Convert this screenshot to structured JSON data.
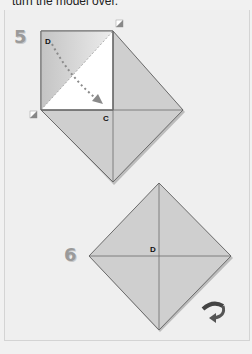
{
  "instruction_text": "turn the model over.",
  "steps": [
    {
      "number": "5",
      "labels": {
        "corner": "D",
        "center": "C"
      },
      "annotation": "fold corner D to center C"
    },
    {
      "number": "6",
      "labels": {
        "center": "D"
      },
      "annotation": "turn over symbol"
    }
  ],
  "colors": {
    "paper_fill": "#cfcfcf",
    "paper_white": "#ffffff",
    "edge": "#6b6b6b",
    "arrow": "#8a8a8a",
    "background": "#f1f1f1"
  }
}
